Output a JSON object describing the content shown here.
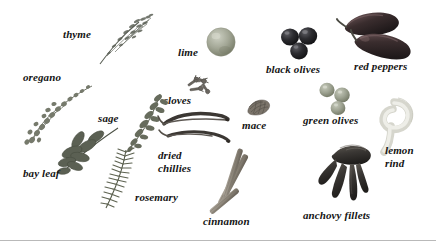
{
  "figure": {
    "title": "",
    "background_color": "#ffffff",
    "width": 436,
    "height": 241,
    "label_color": "#141414",
    "rule_color": "#b9b9b9"
  },
  "items": [
    {
      "id": "thyme",
      "label": "thyme",
      "icon": "thyme-sprig",
      "label_x": 63,
      "label_y": 28,
      "art_x": 95,
      "art_y": 10,
      "colors": {
        "main": "#6e7368",
        "dark": "#4a4f45"
      }
    },
    {
      "id": "lime",
      "label": "lime",
      "icon": "lime-fruit",
      "label_x": 178,
      "label_y": 46,
      "art_x": 205,
      "art_y": 26,
      "colors": {
        "main": "#9a9f8e",
        "dark": "#70765f",
        "light": "#c3c7b8"
      }
    },
    {
      "id": "black-olives",
      "label": "black olives",
      "icon": "black-olives-cluster",
      "label_x": 266,
      "label_y": 63,
      "art_x": 280,
      "art_y": 28,
      "colors": {
        "main": "#2a2a2c",
        "dark": "#161617",
        "light": "#57575b"
      }
    },
    {
      "id": "red-peppers",
      "label": "red peppers",
      "icon": "red-peppers-pair",
      "label_x": 354,
      "label_y": 60,
      "art_x": 340,
      "art_y": 12,
      "colors": {
        "main": "#403132",
        "dark": "#231b1c",
        "light": "#6a5354"
      }
    },
    {
      "id": "oregano",
      "label": "oregano",
      "icon": "oregano-sprig",
      "label_x": 23,
      "label_y": 71,
      "art_x": 25,
      "art_y": 85,
      "colors": {
        "main": "#7d7f74",
        "dark": "#565950"
      }
    },
    {
      "id": "cloves",
      "label": "cloves",
      "icon": "cloves-pile",
      "label_x": 163,
      "label_y": 94,
      "art_x": 186,
      "art_y": 74,
      "colors": {
        "main": "#63605a",
        "dark": "#403d39"
      }
    },
    {
      "id": "sage",
      "label": "sage",
      "icon": "sage-sprig",
      "label_x": 98,
      "label_y": 112,
      "art_x": 128,
      "art_y": 95,
      "colors": {
        "main": "#6d7167",
        "dark": "#494d44"
      }
    },
    {
      "id": "mace",
      "label": "mace",
      "icon": "mace-blade",
      "label_x": 242,
      "label_y": 119,
      "art_x": 246,
      "art_y": 97,
      "colors": {
        "main": "#7b7469",
        "dark": "#554f46"
      }
    },
    {
      "id": "green-olives",
      "label": "green olives",
      "icon": "green-olives-cluster",
      "label_x": 303,
      "label_y": 114,
      "art_x": 318,
      "art_y": 84,
      "colors": {
        "main": "#9ba08f",
        "dark": "#757a68",
        "light": "#c0c4b5"
      }
    },
    {
      "id": "lemon-rind",
      "label": "lemon\nrind",
      "icon": "lemon-rind-curl",
      "label_x": 385,
      "label_y": 144,
      "art_x": 366,
      "art_y": 95,
      "colors": {
        "main": "#dcdcd4",
        "dark": "#bdbdb2",
        "light": "#f0f0ea"
      }
    },
    {
      "id": "bay-leaf",
      "label": "bay leaf",
      "icon": "bay-leaf-branch",
      "label_x": 23,
      "label_y": 167,
      "art_x": 60,
      "art_y": 128,
      "colors": {
        "main": "#5e6356",
        "dark": "#3d4237"
      }
    },
    {
      "id": "dried-chillies",
      "label": "dried\nchillies",
      "icon": "dried-chillies-pair",
      "label_x": 158,
      "label_y": 149,
      "art_x": 160,
      "art_y": 110,
      "colors": {
        "main": "#504a44",
        "dark": "#2e2a26"
      }
    },
    {
      "id": "rosemary",
      "label": "rosemary",
      "icon": "rosemary-sprig",
      "label_x": 135,
      "label_y": 191,
      "art_x": 100,
      "art_y": 150,
      "colors": {
        "main": "#636857",
        "dark": "#41463a"
      }
    },
    {
      "id": "cinnamon",
      "label": "cinnamon",
      "icon": "cinnamon-sticks",
      "label_x": 203,
      "label_y": 215,
      "art_x": 206,
      "art_y": 155,
      "colors": {
        "main": "#8b8378",
        "dark": "#5f584f",
        "light": "#b3aca1"
      }
    },
    {
      "id": "anchovy-fillets",
      "label": "anchovy fillets",
      "icon": "anchovy-fillets-bundle",
      "label_x": 303,
      "label_y": 209,
      "art_x": 320,
      "art_y": 145,
      "colors": {
        "main": "#3e3b38",
        "dark": "#211f1d",
        "light": "#615c57"
      }
    }
  ]
}
